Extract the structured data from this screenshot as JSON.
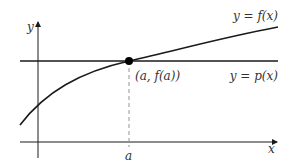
{
  "diagram": {
    "axes": {
      "x_label": "x",
      "y_label": "y"
    },
    "point_label": "(a, f(a))",
    "tick_label": "a",
    "curves": [
      {
        "name": "f",
        "label": "y = f(x)"
      },
      {
        "name": "p",
        "label": "y = p(x)"
      }
    ],
    "colors": {
      "stroke": "#1a1a1a",
      "text": "#333333",
      "dashed": "#888888"
    }
  }
}
